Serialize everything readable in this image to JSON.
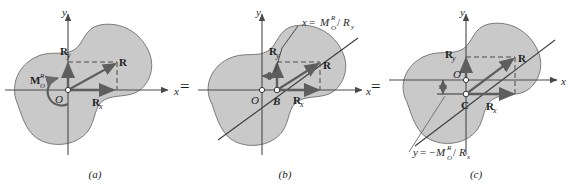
{
  "figure": {
    "type": "mechanics-diagram",
    "background": "#ffffff",
    "body_fill": "#c9c9c9",
    "body_stroke": "#6e6e6e",
    "axis_color": "#4a4a4a",
    "vector_color": "#5e5e5e",
    "text_color": "#1f1f1f"
  },
  "equals": {
    "first": "=",
    "second": "="
  },
  "panels": [
    {
      "id": "a",
      "caption": "(a)",
      "axis_x_label": "x",
      "axis_y_label": "y",
      "origin_label": "O",
      "point_label": "O",
      "vectors": [
        {
          "name": "R",
          "label": "R"
        },
        {
          "name": "Rx",
          "label": "R",
          "sub": "x"
        },
        {
          "name": "Ry",
          "label": "R",
          "sub": "y"
        }
      ],
      "moment": {
        "label": "M",
        "sup": "R",
        "sub": "O"
      },
      "line_of_action": false,
      "formula": null
    },
    {
      "id": "b",
      "caption": "(b)",
      "axis_x_label": "x",
      "axis_y_label": "y",
      "origin_label": "O",
      "point_label": "B",
      "vectors": [
        {
          "name": "R",
          "label": "R"
        },
        {
          "name": "Rx",
          "label": "R",
          "sub": "x"
        },
        {
          "name": "Ry",
          "label": "R",
          "sub": "y"
        }
      ],
      "moment": null,
      "line_of_action": true,
      "formula": {
        "lhs": "x",
        "eq": "=",
        "num": "M",
        "num_sup": "R",
        "num_sub": "O",
        "slash": "/",
        "den": "R",
        "den_sub": "y",
        "text": "x = M_O^R / R_y"
      }
    },
    {
      "id": "c",
      "caption": "(c)",
      "axis_x_label": "x",
      "axis_y_label": "y",
      "origin_label": "O",
      "point_label": "C",
      "vectors": [
        {
          "name": "R",
          "label": "R"
        },
        {
          "name": "Rx",
          "label": "R",
          "sub": "x"
        },
        {
          "name": "Ry",
          "label": "R",
          "sub": "y"
        }
      ],
      "moment": null,
      "line_of_action": true,
      "formula": {
        "lhs": "y",
        "eq": "=",
        "sign": "−",
        "num": "M",
        "num_sup": "R",
        "num_sub": "O",
        "slash": "/",
        "den": "R",
        "den_sub": "x",
        "text": "y = -M_O^R / R_x"
      }
    }
  ]
}
